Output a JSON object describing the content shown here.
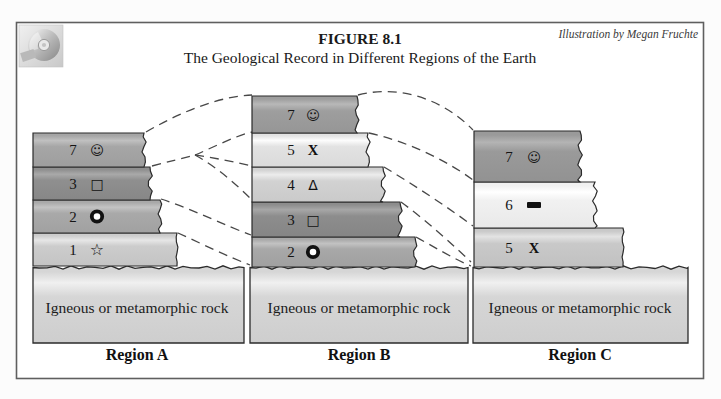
{
  "header": {
    "figure_label": "FIGURE 8.1",
    "title": "The Geological Record in Different Regions of the Earth",
    "credit": "Illustration by Megan Fruchte"
  },
  "colors": {
    "frame_border": "#5f5f5f",
    "layer_border": "#2b2b2b",
    "dashed_line": "#474747",
    "basement_fill": "#d6d6d6",
    "background": "#ffffff"
  },
  "regions": [
    {
      "name": "Region A",
      "base_label": "Igneous or metamorphic rock",
      "layers": [
        {
          "number": "7",
          "symbol": "smiley",
          "glyph": "☺",
          "fill": "#a6a6a6"
        },
        {
          "number": "3",
          "symbol": "square",
          "glyph": "□",
          "fill": "#8f8f8f"
        },
        {
          "number": "2",
          "symbol": "ring",
          "glyph": "O",
          "fill": "#a9a9a9"
        },
        {
          "number": "1",
          "symbol": "star",
          "glyph": "☆",
          "fill": "#cccccc"
        }
      ]
    },
    {
      "name": "Region B",
      "base_label": "Igneous or metamorphic rock",
      "layers": [
        {
          "number": "7",
          "symbol": "smiley",
          "glyph": "☺",
          "fill": "#9e9e9e"
        },
        {
          "number": "5",
          "symbol": "x-mark",
          "glyph": "X",
          "fill": "#e2e2e2"
        },
        {
          "number": "4",
          "symbol": "triangle",
          "glyph": "Δ",
          "fill": "#d2d2d2"
        },
        {
          "number": "3",
          "symbol": "square",
          "glyph": "□",
          "fill": "#8d8d8d"
        },
        {
          "number": "2",
          "symbol": "ring",
          "glyph": "O",
          "fill": "#a8a8a8"
        }
      ]
    },
    {
      "name": "Region C",
      "base_label": "Igneous or metamorphic rock",
      "layers": [
        {
          "number": "7",
          "symbol": "smiley",
          "glyph": "☺",
          "fill": "#9a9a9a"
        },
        {
          "number": "6",
          "symbol": "bar",
          "glyph": "▬",
          "fill": "#f1f1f1"
        },
        {
          "number": "5",
          "symbol": "x-mark",
          "glyph": "X",
          "fill": "#c9c9c9"
        }
      ]
    }
  ]
}
